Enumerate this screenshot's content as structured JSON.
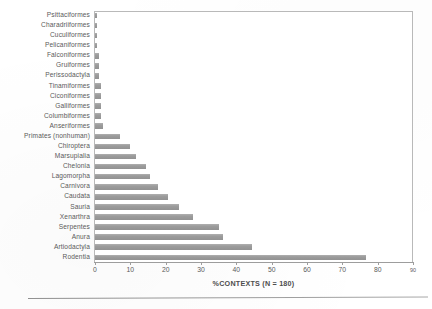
{
  "chart_data": {
    "type": "bar",
    "orientation": "horizontal",
    "title": "",
    "subtitle": "",
    "xlabel": "%CONTEXTS (N = 180)",
    "ylabel": "",
    "xlim": [
      0,
      90
    ],
    "xticks": [
      0,
      10,
      20,
      30,
      40,
      50,
      60,
      70,
      80,
      90
    ],
    "grid": false,
    "legend": null,
    "bar_color": "#9a9a9a",
    "frame_color": "#b9b9b9",
    "categories": [
      "Psittaciformes",
      "Charadriiformes",
      "Cuculiformes",
      "Pelicaniformes",
      "Falconiformes",
      "Gruiformes",
      "Perissodactyla",
      "Tinamiformes",
      "Ciconiformes",
      "Galliformes",
      "Columbiformes",
      "Anseriformes",
      "Primates (nonhuman)",
      "Chiroptera",
      "Marsupialia",
      "Chelonia",
      "Lagomorpha",
      "Carnivora",
      "Caudata",
      "Sauria",
      "Xenarthra",
      "Serpentes",
      "Anura",
      "Artiodactyla",
      "Rodentia"
    ],
    "values": [
      0.6,
      0.6,
      0.6,
      0.6,
      1.1,
      1.1,
      1.1,
      1.7,
      1.7,
      1.7,
      1.7,
      2.2,
      7.2,
      10.0,
      11.7,
      14.4,
      15.6,
      17.8,
      20.6,
      23.9,
      27.8,
      35.0,
      36.1,
      44.4,
      76.7
    ]
  }
}
